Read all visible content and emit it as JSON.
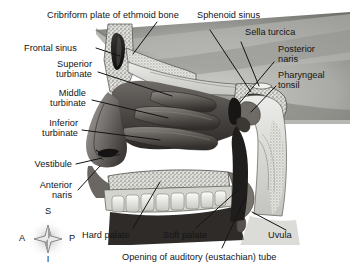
{
  "figure": {
    "type": "anatomical-illustration",
    "view": "midsagittal section",
    "background_color": "#ffffff",
    "ink_color": "#141414"
  },
  "labels": [
    {
      "id": "cribriform-plate",
      "text": "Cribriform plate of ethmoid bone"
    },
    {
      "id": "sphenoid-sinus",
      "text": "Sphenoid sinus"
    },
    {
      "id": "sella-turcica",
      "text": "Sella turcica"
    },
    {
      "id": "frontal-sinus",
      "text": "Frontal sinus"
    },
    {
      "id": "posterior-naris",
      "text": "Posterior\nnaris"
    },
    {
      "id": "superior-turbinate",
      "text": "Superior\nturbinate"
    },
    {
      "id": "pharyngeal-tonsil",
      "text": "Pharyngeal\ntonsil"
    },
    {
      "id": "middle-turbinate",
      "text": "Middle\nturbinate"
    },
    {
      "id": "inferior-turbinate",
      "text": "Inferior\nturbinate"
    },
    {
      "id": "vestibule",
      "text": "Vestibule"
    },
    {
      "id": "anterior-naris",
      "text": "Anterior\nnaris"
    },
    {
      "id": "hard-palate",
      "text": "Hard palate"
    },
    {
      "id": "soft-palate",
      "text": "Soft palate"
    },
    {
      "id": "uvula",
      "text": "Uvula"
    },
    {
      "id": "auditory-tube",
      "text": "Opening of auditory (eustachian) tube"
    }
  ],
  "orientation_compass": {
    "name": "anatomical-orientation-compass",
    "superior": "S",
    "inferior": "I",
    "anterior": "A",
    "posterior": "P"
  }
}
